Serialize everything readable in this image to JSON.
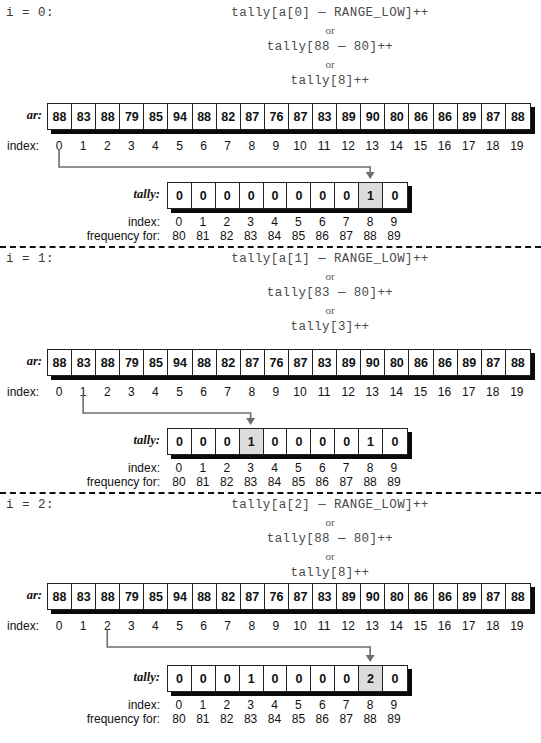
{
  "figure": {
    "array_label": "ar:",
    "tally_label": "tally:",
    "index_label": "index:",
    "frequency_label": "frequency for:",
    "or_text": "or",
    "ar_values": [
      "88",
      "83",
      "88",
      "79",
      "85",
      "94",
      "88",
      "82",
      "87",
      "76",
      "87",
      "83",
      "89",
      "90",
      "80",
      "86",
      "86",
      "89",
      "87",
      "88"
    ],
    "ar_indices": [
      "0",
      "1",
      "2",
      "3",
      "4",
      "5",
      "6",
      "7",
      "8",
      "9",
      "10",
      "11",
      "12",
      "13",
      "14",
      "15",
      "16",
      "17",
      "18",
      "19"
    ],
    "tally_indices": [
      "0",
      "1",
      "2",
      "3",
      "4",
      "5",
      "6",
      "7",
      "8",
      "9"
    ],
    "tally_frequencies": [
      "80",
      "81",
      "82",
      "83",
      "84",
      "85",
      "86",
      "87",
      "88",
      "89"
    ],
    "highlight_color": "#dcdcdc",
    "shadow_color": "#0a0a0a",
    "connector_color": "#6e6e6e"
  },
  "sections": [
    {
      "iter_label": "i = 0:",
      "code1": "tally[a[0] — RANGE_LOW]++",
      "code2": "tally[88 — 80]++",
      "code3": "tally[8]++",
      "source_index": 0,
      "target_index": 8,
      "tally_values": [
        "0",
        "0",
        "0",
        "0",
        "0",
        "0",
        "0",
        "0",
        "1",
        "0"
      ]
    },
    {
      "iter_label": "i = 1:",
      "code1": "tally[a[1] — RANGE_LOW]++",
      "code2": "tally[83 — 80]++",
      "code3": "tally[3]++",
      "source_index": 1,
      "target_index": 3,
      "tally_values": [
        "0",
        "0",
        "0",
        "1",
        "0",
        "0",
        "0",
        "0",
        "1",
        "0"
      ]
    },
    {
      "iter_label": "i = 2:",
      "code1": "tally[a[2] — RANGE_LOW]++",
      "code2": "tally[88 — 80]++",
      "code3": "tally[8]++",
      "source_index": 2,
      "target_index": 8,
      "tally_values": [
        "0",
        "0",
        "0",
        "1",
        "0",
        "0",
        "0",
        "0",
        "2",
        "0"
      ]
    }
  ]
}
